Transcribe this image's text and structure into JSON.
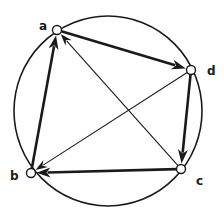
{
  "diagram": {
    "type": "directed-graph-on-circle",
    "circle": {
      "cx": 108,
      "cy": 111,
      "rx": 94,
      "ry": 95,
      "stroke": "#1a1a1a",
      "stroke_width": 1.6
    },
    "nodes": [
      {
        "id": "a",
        "label": "a",
        "x": 57,
        "y": 30,
        "label_x": 39,
        "label_y": 20
      },
      {
        "id": "d",
        "label": "d",
        "x": 191,
        "y": 70,
        "label_x": 207,
        "label_y": 65
      },
      {
        "id": "b",
        "label": "b",
        "x": 31,
        "y": 173,
        "label_x": 10,
        "label_y": 170
      },
      {
        "id": "c",
        "label": "c",
        "x": 181,
        "y": 169,
        "label_x": 196,
        "label_y": 175
      }
    ],
    "edges": [
      {
        "from": "a",
        "to": "d",
        "weight": "thick"
      },
      {
        "from": "d",
        "to": "c",
        "weight": "thick"
      },
      {
        "from": "c",
        "to": "b",
        "weight": "thick"
      },
      {
        "from": "b",
        "to": "a",
        "weight": "thick"
      },
      {
        "from": "c",
        "to": "a",
        "weight": "thin"
      },
      {
        "from": "d",
        "to": "b",
        "weight": "thin"
      }
    ],
    "colors": {
      "stroke": "#1a1a1a",
      "node_fill": "#ffffff",
      "background": "#ffffff"
    }
  }
}
